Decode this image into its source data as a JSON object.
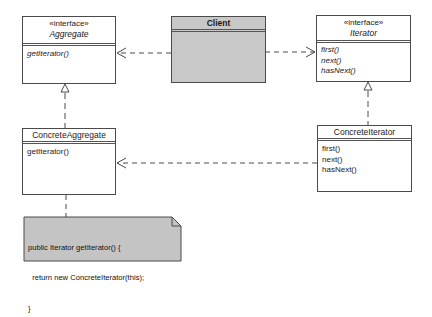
{
  "diagram": {
    "type": "uml-class-diagram",
    "pattern": "Iterator",
    "classes": [
      {
        "id": "aggregate",
        "stereotype": "«interface»",
        "name": "Aggregate",
        "abstract": true,
        "operations": [
          "getIterator()"
        ]
      },
      {
        "id": "client",
        "name": "Client",
        "operations": []
      },
      {
        "id": "iterator",
        "stereotype": "«interface»",
        "name": "Iterator",
        "abstract": true,
        "operations": [
          "first()",
          "next()",
          "hasNext()"
        ]
      },
      {
        "id": "concrete_aggregate",
        "name": "ConcreteAggregate",
        "operations": [
          "getIterator()"
        ]
      },
      {
        "id": "concrete_iterator",
        "name": "ConcreteIterator",
        "operations": [
          "first()",
          "next()",
          "hasNext()"
        ]
      }
    ],
    "relations": [
      {
        "from": "Client",
        "to": "Aggregate",
        "kind": "dependency"
      },
      {
        "from": "Client",
        "to": "Iterator",
        "kind": "dependency"
      },
      {
        "from": "ConcreteAggregate",
        "to": "Aggregate",
        "kind": "realization"
      },
      {
        "from": "ConcreteIterator",
        "to": "Iterator",
        "kind": "realization"
      },
      {
        "from": "ConcreteIterator",
        "to": "ConcreteAggregate",
        "kind": "dependency"
      },
      {
        "from": "Note",
        "to": "ConcreteAggregate",
        "kind": "note-anchor"
      }
    ],
    "note": {
      "lines": [
        "public Iterator getIterator() {",
        "  return new ConcreteIterator(this);",
        "}"
      ]
    }
  },
  "colors": {
    "line": "#4a4a4a",
    "client_fill": "#c8c8c8",
    "note_fill": "#c4c4c4",
    "box_fill": "#ffffff"
  }
}
